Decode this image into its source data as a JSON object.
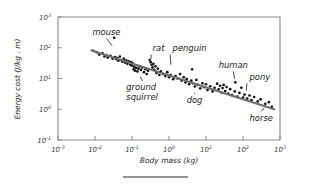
{
  "chart_data": {
    "type": "scatter",
    "title": "",
    "xlabel": "Body mass (kg)",
    "ylabel": "Energy cost (J/kg . m)",
    "xscale": "log",
    "yscale": "log",
    "xlim": [
      0.001,
      1000
    ],
    "ylim": [
      0.1,
      1000
    ],
    "grid": false,
    "legend": null,
    "xticks": [
      {
        "value": 0.001,
        "label": "10",
        "exp": "-3"
      },
      {
        "value": 0.01,
        "label": "10",
        "exp": "-2"
      },
      {
        "value": 0.1,
        "label": "10",
        "exp": "-1"
      },
      {
        "value": 1,
        "label": "10",
        "exp": "0"
      },
      {
        "value": 10,
        "label": "10",
        "exp": "1"
      },
      {
        "value": 100,
        "label": "10",
        "exp": "2"
      },
      {
        "value": 1000,
        "label": "10",
        "exp": "3"
      }
    ],
    "yticks": [
      {
        "value": 0.1,
        "label": "10",
        "exp": "-1"
      },
      {
        "value": 1,
        "label": "10",
        "exp": "0"
      },
      {
        "value": 10,
        "label": "10",
        "exp": "1"
      },
      {
        "value": 100,
        "label": "10",
        "exp": "2"
      },
      {
        "value": 1000,
        "label": "10",
        "exp": "3"
      }
    ],
    "fit_line": {
      "description": "log-log regression of energy cost on body mass",
      "x_start": 0.008,
      "y_start": 82,
      "x_end": 700,
      "y_end": 1.0,
      "color": "#6e6e6e"
    },
    "points": [
      [
        0.009,
        80
      ],
      [
        0.011,
        72
      ],
      [
        0.013,
        60
      ],
      [
        0.016,
        66
      ],
      [
        0.018,
        52
      ],
      [
        0.02,
        58
      ],
      [
        0.022,
        48
      ],
      [
        0.026,
        55
      ],
      [
        0.03,
        44
      ],
      [
        0.033,
        210
      ],
      [
        0.035,
        50
      ],
      [
        0.038,
        42
      ],
      [
        0.04,
        46
      ],
      [
        0.043,
        38
      ],
      [
        0.047,
        52
      ],
      [
        0.05,
        40
      ],
      [
        0.055,
        35
      ],
      [
        0.06,
        44
      ],
      [
        0.065,
        33
      ],
      [
        0.07,
        39
      ],
      [
        0.075,
        30
      ],
      [
        0.082,
        36
      ],
      [
        0.09,
        28
      ],
      [
        0.095,
        34
      ],
      [
        0.1,
        26
      ],
      [
        0.105,
        31
      ],
      [
        0.11,
        20
      ],
      [
        0.115,
        24
      ],
      [
        0.12,
        18
      ],
      [
        0.13,
        22
      ],
      [
        0.14,
        17
      ],
      [
        0.15,
        21
      ],
      [
        0.16,
        25
      ],
      [
        0.175,
        19
      ],
      [
        0.19,
        23
      ],
      [
        0.21,
        16
      ],
      [
        0.23,
        20
      ],
      [
        0.25,
        14
      ],
      [
        0.27,
        18
      ],
      [
        0.3,
        40
      ],
      [
        0.32,
        34
      ],
      [
        0.34,
        28
      ],
      [
        0.36,
        23
      ],
      [
        0.38,
        30
      ],
      [
        0.4,
        19
      ],
      [
        0.43,
        25
      ],
      [
        0.46,
        15
      ],
      [
        0.5,
        21
      ],
      [
        0.55,
        13
      ],
      [
        0.6,
        17
      ],
      [
        0.7,
        14
      ],
      [
        0.8,
        12
      ],
      [
        0.9,
        16
      ],
      [
        1.0,
        11
      ],
      [
        1.1,
        13
      ],
      [
        1.3,
        9.5
      ],
      [
        1.5,
        12
      ],
      [
        1.7,
        10
      ],
      [
        2.0,
        14
      ],
      [
        2.2,
        8.5
      ],
      [
        2.5,
        11
      ],
      [
        2.8,
        7.5
      ],
      [
        3.0,
        9.5
      ],
      [
        3.5,
        6.5
      ],
      [
        4.0,
        8.5
      ],
      [
        4.2,
        20
      ],
      [
        4.5,
        7.0
      ],
      [
        5.0,
        5.5
      ],
      [
        5.5,
        9.0
      ],
      [
        6.0,
        6.2
      ],
      [
        7.0,
        4.8
      ],
      [
        8.0,
        7.0
      ],
      [
        9.0,
        5.2
      ],
      [
        10.0,
        6.5
      ],
      [
        11.0,
        4.2
      ],
      [
        13.0,
        5.6
      ],
      [
        15.0,
        3.8
      ],
      [
        17.0,
        5.0
      ],
      [
        20.0,
        6.8
      ],
      [
        22.0,
        4.4
      ],
      [
        24.0,
        5.8
      ],
      [
        26.0,
        3.5
      ],
      [
        28.0,
        4.9
      ],
      [
        30.0,
        6.2
      ],
      [
        33.0,
        3.9
      ],
      [
        36.0,
        5.3
      ],
      [
        40.0,
        3.2
      ],
      [
        45.0,
        4.5
      ],
      [
        50.0,
        2.9
      ],
      [
        60.0,
        3.8
      ],
      [
        62.0,
        7.5
      ],
      [
        70.0,
        2.6
      ],
      [
        80.0,
        3.4
      ],
      [
        90.0,
        5.0
      ],
      [
        100.0,
        2.4
      ],
      [
        110.0,
        3.0
      ],
      [
        130.0,
        2.2
      ],
      [
        150.0,
        2.8
      ],
      [
        170.0,
        2.0
      ],
      [
        200.0,
        2.5
      ],
      [
        250.0,
        1.8
      ],
      [
        300.0,
        2.1
      ],
      [
        400.0,
        1.5
      ],
      [
        500.0,
        1.7
      ],
      [
        600.0,
        1.2
      ]
    ],
    "annotations": [
      {
        "name": "mouse",
        "label": "mouse",
        "label_x": 0.0085,
        "label_y": 260,
        "point_x": 0.033,
        "point_y": 96
      },
      {
        "name": "rat",
        "label": "rat",
        "label_x": 0.36,
        "label_y": 78,
        "point_x": 0.33,
        "point_y": 34
      },
      {
        "name": "penguin",
        "label": "penguin",
        "label_x": 1.25,
        "label_y": 78,
        "point_x": 1.15,
        "point_y": 22
      },
      {
        "name": "ground-squirrel",
        "label": "ground squirrel",
        "label_x": 0.07,
        "label_y": 4.1,
        "point_x": 0.155,
        "point_y": 14
      },
      {
        "name": "dog",
        "label": "dog",
        "label_x": 3.0,
        "label_y": 1.55,
        "point_x": 5.2,
        "point_y": 4.4
      },
      {
        "name": "human",
        "label": "human",
        "label_x": 22.0,
        "label_y": 22,
        "point_x": 62.0,
        "point_y": 7.5
      },
      {
        "name": "pony",
        "label": "pony",
        "label_x": 150.0,
        "label_y": 9.0,
        "point_x": 120.0,
        "point_y": 3.2
      },
      {
        "name": "horse",
        "label": "horse",
        "label_x": 150.0,
        "label_y": 0.42,
        "point_x": 430.0,
        "point_y": 1.35
      }
    ],
    "footer_rule": true
  }
}
